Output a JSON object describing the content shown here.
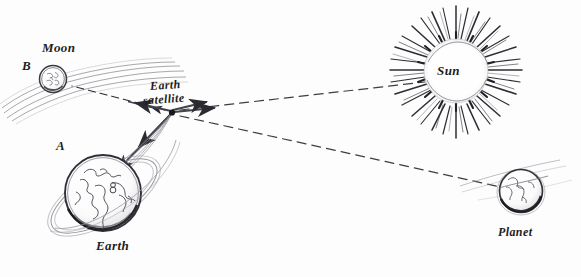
{
  "figure": {
    "style": "hand-drawn pencil sketch, black ink on white paper",
    "background_color": "#fdfdfd",
    "ink_color": "#25252b",
    "width": 581,
    "height": 277
  },
  "labels": {
    "moon": "Moon",
    "point_b": "B",
    "point_a": "A",
    "earth": "Earth",
    "satellite_line1": "Earth",
    "satellite_line2": "satellite",
    "sun": "Sun",
    "planet": "Planet"
  },
  "bodies": [
    {
      "name": "moon",
      "label": "Moon",
      "marker": "B",
      "cx": 53,
      "cy": 79,
      "r": 13,
      "has_orbit_streaks": true
    },
    {
      "name": "earth",
      "label": "Earth",
      "marker": "A",
      "cx": 103,
      "cy": 193,
      "r": 38,
      "has_orbit_ring": true,
      "has_continents": true
    },
    {
      "name": "sun",
      "label": "Sun",
      "cx": 456,
      "cy": 72,
      "r": 32,
      "ray_count": 48,
      "ray_length": 36
    },
    {
      "name": "planet",
      "label": "Planet",
      "cx": 521,
      "cy": 193,
      "r": 22,
      "has_orbit_ring": true,
      "has_continents": true
    },
    {
      "name": "earth-satellite",
      "label": "Earth satellite",
      "cx": 172,
      "cy": 112,
      "r": 3,
      "marker_style": "filled-dot"
    }
  ],
  "sight_lines": [
    {
      "name": "satellite-to-moon",
      "from": "earth-satellite",
      "to": "moon",
      "style": "dashed",
      "arrow": "toward-target"
    },
    {
      "name": "satellite-to-sun",
      "from": "earth-satellite",
      "to": "sun",
      "style": "dashed",
      "arrow": "toward-target"
    },
    {
      "name": "satellite-to-planet",
      "from": "earth-satellite",
      "to": "planet",
      "style": "dashed",
      "arrow": "toward-target"
    },
    {
      "name": "satellite-to-earth",
      "from": "earth-satellite",
      "to": "earth",
      "style": "solid",
      "arrow": "toward-target"
    }
  ]
}
